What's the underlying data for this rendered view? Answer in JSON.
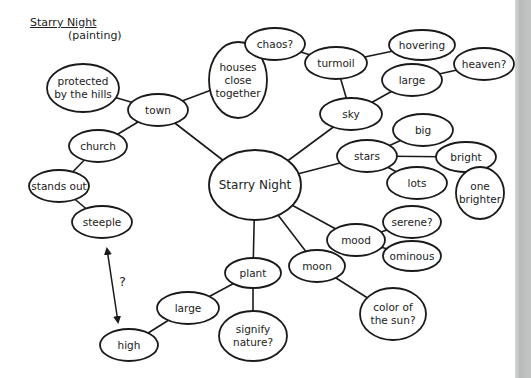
{
  "header": {
    "title": "Starry Night",
    "subtitle": "(painting)"
  },
  "colors": {
    "ink": "#1a1a1a",
    "background": "#ffffff",
    "edge_strip": "#c0c2c1"
  },
  "nodes": [
    {
      "id": "center",
      "lines": [
        "Starry Night"
      ],
      "cx": 255,
      "cy": 185,
      "rx": 46,
      "ry": 35
    },
    {
      "id": "town",
      "lines": [
        "town"
      ],
      "cx": 158,
      "cy": 110,
      "rx": 30,
      "ry": 16
    },
    {
      "id": "protected",
      "lines": [
        "protected",
        "by the hills"
      ],
      "cx": 83,
      "cy": 88,
      "rx": 36,
      "ry": 24
    },
    {
      "id": "houses",
      "lines": [
        "houses",
        "close",
        "together"
      ],
      "cx": 238,
      "cy": 80,
      "rx": 29,
      "ry": 38
    },
    {
      "id": "church",
      "lines": [
        "church"
      ],
      "cx": 98,
      "cy": 146,
      "rx": 29,
      "ry": 16
    },
    {
      "id": "stands_out",
      "lines": [
        "stands out"
      ],
      "cx": 59,
      "cy": 186,
      "rx": 30,
      "ry": 16
    },
    {
      "id": "steeple",
      "lines": [
        "steeple"
      ],
      "cx": 102,
      "cy": 222,
      "rx": 30,
      "ry": 16
    },
    {
      "id": "sky",
      "lines": [
        "sky"
      ],
      "cx": 351,
      "cy": 114,
      "rx": 31,
      "ry": 16
    },
    {
      "id": "turmoil",
      "lines": [
        "turmoil"
      ],
      "cx": 336,
      "cy": 63,
      "rx": 31,
      "ry": 16
    },
    {
      "id": "chaos",
      "lines": [
        "chaos?"
      ],
      "cx": 275,
      "cy": 44,
      "rx": 30,
      "ry": 16
    },
    {
      "id": "hovering",
      "lines": [
        "hovering"
      ],
      "cx": 422,
      "cy": 45,
      "rx": 33,
      "ry": 15
    },
    {
      "id": "sky_large",
      "lines": [
        "large"
      ],
      "cx": 412,
      "cy": 80,
      "rx": 30,
      "ry": 16
    },
    {
      "id": "heaven",
      "lines": [
        "heaven?"
      ],
      "cx": 484,
      "cy": 64,
      "rx": 30,
      "ry": 16
    },
    {
      "id": "stars",
      "lines": [
        "stars"
      ],
      "cx": 367,
      "cy": 156,
      "rx": 30,
      "ry": 16
    },
    {
      "id": "big",
      "lines": [
        "big"
      ],
      "cx": 423,
      "cy": 130,
      "rx": 30,
      "ry": 16
    },
    {
      "id": "bright",
      "lines": [
        "bright"
      ],
      "cx": 466,
      "cy": 157,
      "rx": 30,
      "ry": 15
    },
    {
      "id": "lots",
      "lines": [
        "lots"
      ],
      "cx": 417,
      "cy": 183,
      "rx": 30,
      "ry": 16
    },
    {
      "id": "one_brighter",
      "lines": [
        "one",
        "brighter"
      ],
      "cx": 480,
      "cy": 193,
      "rx": 24,
      "ry": 26
    },
    {
      "id": "mood",
      "lines": [
        "mood"
      ],
      "cx": 356,
      "cy": 240,
      "rx": 29,
      "ry": 16
    },
    {
      "id": "serene",
      "lines": [
        "serene?"
      ],
      "cx": 412,
      "cy": 222,
      "rx": 29,
      "ry": 16
    },
    {
      "id": "ominous",
      "lines": [
        "ominous"
      ],
      "cx": 412,
      "cy": 256,
      "rx": 29,
      "ry": 15
    },
    {
      "id": "moon",
      "lines": [
        "moon"
      ],
      "cx": 317,
      "cy": 266,
      "rx": 28,
      "ry": 16
    },
    {
      "id": "color_sun",
      "lines": [
        "color of",
        "the sun?"
      ],
      "cx": 393,
      "cy": 314,
      "rx": 33,
      "ry": 26
    },
    {
      "id": "plant",
      "lines": [
        "plant"
      ],
      "cx": 253,
      "cy": 273,
      "rx": 28,
      "ry": 15
    },
    {
      "id": "plant_large",
      "lines": [
        "large"
      ],
      "cx": 188,
      "cy": 308,
      "rx": 31,
      "ry": 16
    },
    {
      "id": "signify",
      "lines": [
        "signify",
        "nature?"
      ],
      "cx": 253,
      "cy": 336,
      "rx": 34,
      "ry": 25
    },
    {
      "id": "high",
      "lines": [
        "high"
      ],
      "cx": 129,
      "cy": 345,
      "rx": 29,
      "ry": 16
    }
  ],
  "edges": [
    [
      "center",
      "town"
    ],
    [
      "town",
      "protected"
    ],
    [
      "town",
      "houses"
    ],
    [
      "town",
      "church"
    ],
    [
      "church",
      "stands_out"
    ],
    [
      "stands_out",
      "steeple"
    ],
    [
      "center",
      "sky"
    ],
    [
      "sky",
      "turmoil"
    ],
    [
      "turmoil",
      "chaos"
    ],
    [
      "turmoil",
      "hovering"
    ],
    [
      "sky",
      "sky_large"
    ],
    [
      "sky_large",
      "heaven"
    ],
    [
      "center",
      "stars"
    ],
    [
      "stars",
      "big"
    ],
    [
      "stars",
      "bright"
    ],
    [
      "stars",
      "lots"
    ],
    [
      "bright",
      "one_brighter"
    ],
    [
      "center",
      "mood"
    ],
    [
      "mood",
      "serene"
    ],
    [
      "mood",
      "ominous"
    ],
    [
      "center",
      "moon"
    ],
    [
      "moon",
      "color_sun"
    ],
    [
      "center",
      "plant"
    ],
    [
      "plant",
      "plant_large"
    ],
    [
      "plant",
      "signify"
    ],
    [
      "plant_large",
      "high"
    ]
  ],
  "annotation": {
    "arrow": {
      "x1": 107,
      "y1": 249,
      "x2": 118,
      "y2": 322,
      "double_headed": true
    },
    "label": "?",
    "label_x": 119,
    "label_y": 286
  }
}
